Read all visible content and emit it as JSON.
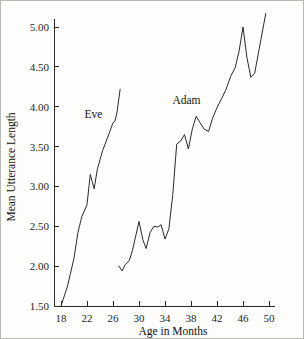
{
  "chart_data": {
    "type": "line",
    "title": "",
    "xlabel": "Age in Months",
    "ylabel": "Mean Utterance Length",
    "xlim": [
      17.0,
      50.6
    ],
    "ylim": [
      1.5,
      5.25
    ],
    "grid": false,
    "legend_position": "inline-annotations",
    "xticks": [
      18,
      22,
      26,
      30,
      34,
      38,
      42,
      46,
      50
    ],
    "xtick_labels": [
      "18",
      "22",
      "26",
      "30",
      "34",
      "38",
      "42",
      "46",
      "50"
    ],
    "yticks": [
      1.5,
      2.0,
      2.5,
      3.0,
      3.5,
      4.0,
      4.5,
      5.0
    ],
    "ytick_labels": [
      "1.50",
      "2.00",
      "2.50",
      "3.00",
      "3.50",
      "4.00",
      "4.50",
      "5.00"
    ],
    "line_color": "#2a2a2a",
    "series": [
      {
        "name": "Eve",
        "label_x": 23.0,
        "label_y": 3.86,
        "x": [
          18.0,
          19.0,
          20.0,
          20.6,
          21.2,
          22.0,
          22.5,
          23.1,
          23.6,
          24.4,
          25.2,
          26.0,
          26.3,
          26.6,
          27.1
        ],
        "y": [
          1.5,
          1.75,
          2.1,
          2.42,
          2.62,
          2.77,
          3.15,
          2.97,
          3.22,
          3.45,
          3.62,
          3.8,
          3.82,
          3.92,
          4.22
        ]
      },
      {
        "name": "Adam",
        "label_x": 37.3,
        "label_y": 4.03,
        "x": [
          26.9,
          27.4,
          27.9,
          28.5,
          29.0,
          29.5,
          30.0,
          30.6,
          31.1,
          31.7,
          32.3,
          32.9,
          33.4,
          34.0,
          34.6,
          35.2,
          35.8,
          36.4,
          37.0,
          37.6,
          38.2,
          38.8,
          39.4,
          40.0,
          40.7,
          41.3,
          42.0,
          42.7,
          43.4,
          44.1,
          44.8,
          45.4,
          46.0,
          46.6,
          47.2,
          47.8,
          49.5
        ],
        "y": [
          2.0,
          1.94,
          2.02,
          2.07,
          2.2,
          2.38,
          2.56,
          2.33,
          2.22,
          2.42,
          2.5,
          2.49,
          2.52,
          2.34,
          2.47,
          2.9,
          3.53,
          3.57,
          3.65,
          3.47,
          3.72,
          3.88,
          3.8,
          3.72,
          3.69,
          3.85,
          3.99,
          4.1,
          4.22,
          4.38,
          4.49,
          4.7,
          5.0,
          4.62,
          4.37,
          4.42,
          5.17
        ]
      }
    ]
  }
}
